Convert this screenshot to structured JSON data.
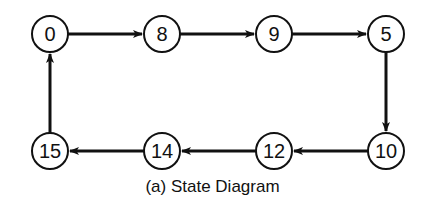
{
  "diagram": {
    "nodes": [
      {
        "id": "0",
        "label": "0",
        "x": 50,
        "y": 34
      },
      {
        "id": "8",
        "label": "8",
        "x": 162,
        "y": 34
      },
      {
        "id": "9",
        "label": "9",
        "x": 274,
        "y": 34
      },
      {
        "id": "5",
        "label": "5",
        "x": 386,
        "y": 34
      },
      {
        "id": "10",
        "label": "10",
        "x": 386,
        "y": 151
      },
      {
        "id": "12",
        "label": "12",
        "x": 274,
        "y": 151
      },
      {
        "id": "14",
        "label": "14",
        "x": 162,
        "y": 151
      },
      {
        "id": "15",
        "label": "15",
        "x": 50,
        "y": 151
      }
    ],
    "edges": [
      {
        "from": "0",
        "to": "8"
      },
      {
        "from": "8",
        "to": "9"
      },
      {
        "from": "9",
        "to": "5"
      },
      {
        "from": "5",
        "to": "10"
      },
      {
        "from": "10",
        "to": "12"
      },
      {
        "from": "12",
        "to": "14"
      },
      {
        "from": "14",
        "to": "15"
      },
      {
        "from": "15",
        "to": "0"
      }
    ],
    "caption": "(a) State Diagram",
    "node_radius": 18,
    "stroke_color": "#111111"
  }
}
